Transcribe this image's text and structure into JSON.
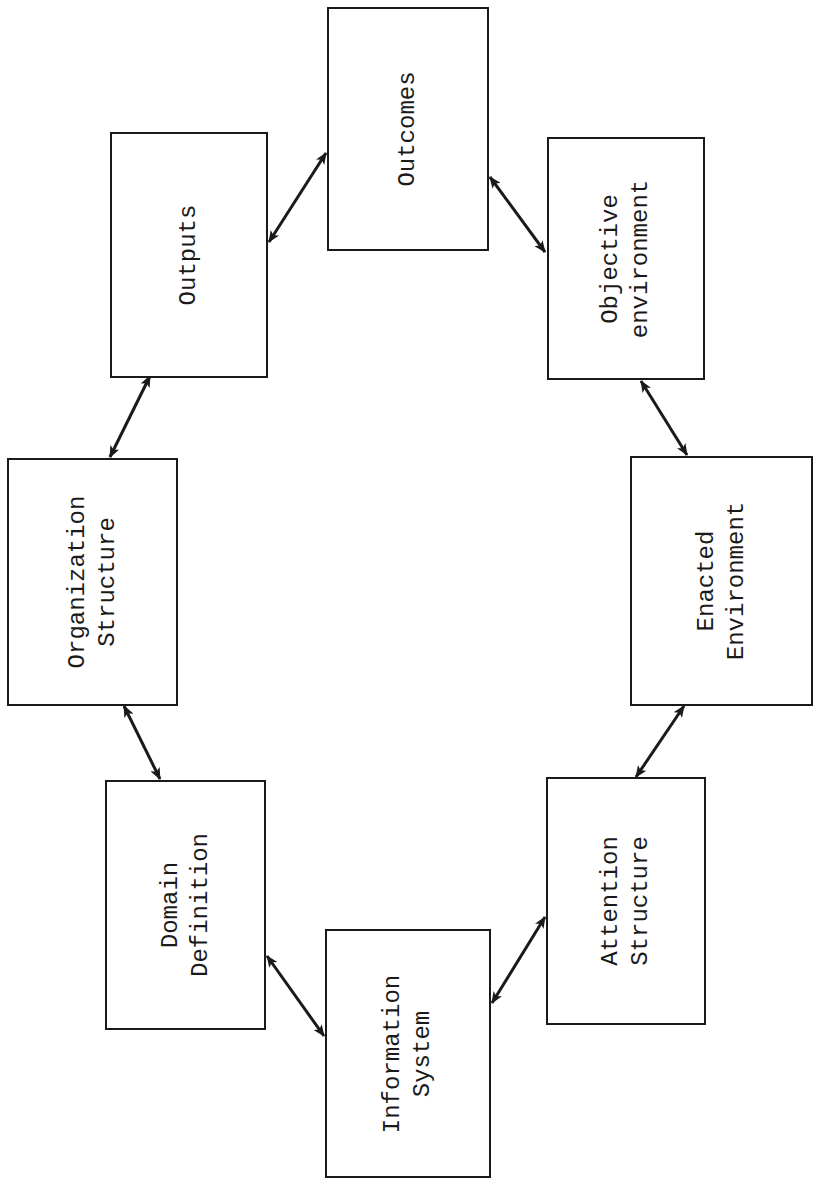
{
  "diagram": {
    "type": "cycle",
    "boxes": [
      {
        "id": "outcomes",
        "lines": [
          "Outcomes"
        ]
      },
      {
        "id": "outputs",
        "lines": [
          "Outputs"
        ]
      },
      {
        "id": "objective",
        "lines": [
          "Objective",
          "environment"
        ]
      },
      {
        "id": "organization",
        "lines": [
          "Organization",
          "Structure"
        ]
      },
      {
        "id": "enacted",
        "lines": [
          "Enacted",
          "Environment"
        ]
      },
      {
        "id": "domain",
        "lines": [
          "Domain",
          "Definition"
        ]
      },
      {
        "id": "attention",
        "lines": [
          "Attention",
          "Structure"
        ]
      },
      {
        "id": "information",
        "lines": [
          "Information",
          "System"
        ]
      }
    ],
    "connections": [
      {
        "from": "Outputs",
        "to": "Outcomes",
        "style": "double-arrow"
      },
      {
        "from": "Outcomes",
        "to": "Objective environment",
        "style": "double-arrow"
      },
      {
        "from": "Objective environment",
        "to": "Enacted Environment",
        "style": "double-arrow"
      },
      {
        "from": "Enacted Environment",
        "to": "Attention Structure",
        "style": "double-arrow"
      },
      {
        "from": "Attention Structure",
        "to": "Information System",
        "style": "double-arrow"
      },
      {
        "from": "Information System",
        "to": "Domain Definition",
        "style": "double-arrow"
      },
      {
        "from": "Domain Definition",
        "to": "Organization Structure",
        "style": "double-arrow"
      },
      {
        "from": "Organization Structure",
        "to": "Outputs",
        "style": "double-arrow"
      }
    ],
    "colors": {
      "stroke": "#1a1a1a",
      "background": "#ffffff"
    }
  }
}
